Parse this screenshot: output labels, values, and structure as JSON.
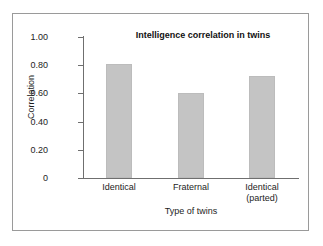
{
  "chart_data": {
    "type": "bar",
    "title": "Intelligence correlation in twins",
    "xlabel": "Type of twins",
    "ylabel": "Correlation",
    "categories": [
      "Identical",
      "Fraternal",
      "Identical\n(parted)"
    ],
    "values": [
      0.81,
      0.6,
      0.72
    ],
    "ylim": [
      0,
      1.0
    ],
    "yticks": [
      "0",
      "0.20",
      "0.40",
      "0.60",
      "0.80",
      "1.00"
    ],
    "ytick_values": [
      0,
      0.2,
      0.4,
      0.6,
      0.8,
      1.0
    ],
    "grid": false,
    "legend": false,
    "bar_color": "#c4c4c4",
    "axis_color": "#6f6f6f",
    "frame_color": "#9a9a9a",
    "background": "#ffffff"
  }
}
